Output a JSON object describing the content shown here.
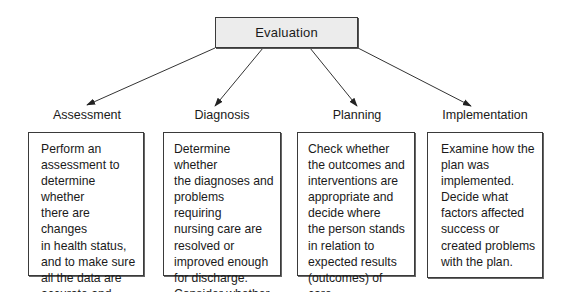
{
  "diagram": {
    "root": {
      "label": "Evaluation",
      "fill_color": "#ececec",
      "border_color": "#3a3a3a"
    },
    "stages": [
      {
        "label": "Assessment",
        "description": "Perform an\nassessment to\ndetermine whether\nthere are changes\nin health status,\nand to make sure\nall the data are\naccurate and\ncomplete."
      },
      {
        "label": "Diagnosis",
        "description": "Determine whether\nthe diagnoses and\nproblems requiring\nnursing care are\nresolved or\nimproved enough\nfor discharge.\nConsider whether\nthere are new\nproblems."
      },
      {
        "label": "Planning",
        "description": "Check whether\nthe outcomes and\ninterventions are\nappropriate and\ndecide where\nthe person stands\nin relation to\nexpected results\n(outcomes) of care."
      },
      {
        "label": "Implementation",
        "description": "Examine how the\nplan was\nimplemented.\nDecide what\nfactors affected\nsuccess or\ncreated problems\nwith the plan."
      }
    ],
    "arrows": [
      {
        "from": "Evaluation",
        "to": "Assessment"
      },
      {
        "from": "Evaluation",
        "to": "Diagnosis"
      },
      {
        "from": "Evaluation",
        "to": "Planning"
      },
      {
        "from": "Evaluation",
        "to": "Implementation"
      }
    ]
  }
}
